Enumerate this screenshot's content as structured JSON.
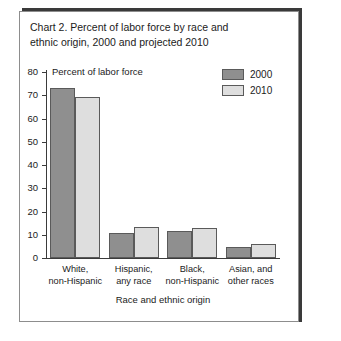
{
  "chart_data": {
    "type": "bar",
    "title": "Chart 2. Percent of labor force by race and\nethnic origin, 2000 and projected 2010",
    "subtitle": "",
    "xlabel": "Race and ethnic origin",
    "ylabel": "Percent of labor force",
    "ylim": [
      0,
      80
    ],
    "yticks": [
      0,
      10,
      20,
      30,
      40,
      50,
      60,
      70,
      80
    ],
    "ytick_labels": [
      "0",
      "10",
      "20",
      "30",
      "40",
      "50",
      "60",
      "70",
      "80"
    ],
    "grid": false,
    "legend_position": "top-right",
    "categories": [
      "White,\nnon-Hispanic",
      "Hispanic,\nany race",
      "Black,\nnon-Hispanic",
      "Asian, and\nother races"
    ],
    "series": [
      {
        "name": "2000",
        "color": "#8f8f8f",
        "values": [
          73.1,
          10.9,
          11.8,
          4.7
        ]
      },
      {
        "name": "2010",
        "color": "#dedede",
        "values": [
          69.2,
          13.3,
          12.7,
          6.1
        ]
      }
    ]
  },
  "figure": {
    "border_color": "#8d8d8d",
    "shadow_color": "#3a3a3a",
    "background": "#ffffff",
    "axis_color": "#3b3b3b"
  }
}
